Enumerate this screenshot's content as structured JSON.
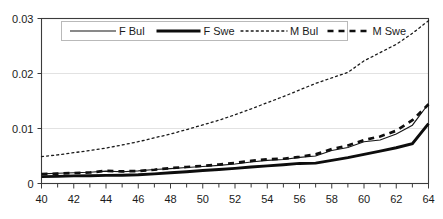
{
  "chart_data": {
    "type": "line",
    "title": "",
    "xlabel": "",
    "ylabel": "",
    "xlim": [
      40,
      64
    ],
    "ylim": [
      0,
      0.03
    ],
    "grid": "horizontal-light",
    "legend_position": "top-inside",
    "y_ticks": [
      "0",
      "0.01",
      "0.02",
      "0.03"
    ],
    "y_tick_values": [
      0,
      0.01,
      0.02,
      0.03
    ],
    "x_ticks": [
      "40",
      "42",
      "44",
      "46",
      "48",
      "50",
      "52",
      "54",
      "56",
      "58",
      "60",
      "62",
      "64"
    ],
    "x_tick_values": [
      40,
      42,
      44,
      46,
      48,
      50,
      52,
      54,
      56,
      58,
      60,
      62,
      64
    ],
    "x_minor_tick_values": [
      41,
      43,
      45,
      47,
      49,
      51,
      53,
      55,
      57,
      59,
      61,
      63
    ],
    "x": [
      40,
      41,
      42,
      43,
      44,
      45,
      46,
      47,
      48,
      49,
      50,
      51,
      52,
      53,
      54,
      55,
      56,
      57,
      58,
      59,
      60,
      61,
      62,
      63,
      64
    ],
    "series": [
      {
        "name": "F Bul",
        "style": "thin-solid",
        "color": "#151515",
        "values": [
          0.00175,
          0.00185,
          0.00195,
          0.00205,
          0.00225,
          0.00215,
          0.0023,
          0.00255,
          0.0027,
          0.0029,
          0.0031,
          0.0033,
          0.00355,
          0.0039,
          0.0042,
          0.00435,
          0.00475,
          0.005,
          0.006,
          0.00655,
          0.0076,
          0.0079,
          0.009,
          0.0106,
          0.0145
        ]
      },
      {
        "name": "F Swe",
        "style": "thick-solid",
        "color": "#0d0d0d",
        "values": [
          0.00125,
          0.0013,
          0.00138,
          0.00142,
          0.00148,
          0.0015,
          0.00158,
          0.00175,
          0.00195,
          0.00215,
          0.00235,
          0.00255,
          0.00275,
          0.003,
          0.0032,
          0.0034,
          0.00365,
          0.0037,
          0.0042,
          0.0047,
          0.0053,
          0.0059,
          0.0065,
          0.00725,
          0.0109
        ]
      },
      {
        "name": "M Bul",
        "style": "dotted",
        "color": "#1a1a1a",
        "values": [
          0.0049,
          0.0052,
          0.0056,
          0.006,
          0.00645,
          0.007,
          0.0076,
          0.0083,
          0.009,
          0.0098,
          0.01065,
          0.0115,
          0.0125,
          0.01355,
          0.0147,
          0.0158,
          0.017,
          0.0182,
          0.0192,
          0.0202,
          0.0223,
          0.0238,
          0.0253,
          0.0273,
          0.0296
        ]
      },
      {
        "name": "M Swe",
        "style": "dashed",
        "color": "#0f0f0f",
        "values": [
          0.0017,
          0.0018,
          0.0019,
          0.002,
          0.0023,
          0.0022,
          0.00228,
          0.0025,
          0.0028,
          0.003,
          0.0032,
          0.00345,
          0.00375,
          0.0041,
          0.0044,
          0.0045,
          0.00485,
          0.0053,
          0.00625,
          0.0069,
          0.0079,
          0.00855,
          0.0096,
          0.0115,
          0.0144
        ]
      }
    ]
  },
  "legend": {
    "items": [
      {
        "label": "F Bul",
        "style": "thin-solid"
      },
      {
        "label": "F Swe",
        "style": "thick-solid"
      },
      {
        "label": "M Bul",
        "style": "dotted"
      },
      {
        "label": "M Swe",
        "style": "dashed"
      }
    ]
  }
}
